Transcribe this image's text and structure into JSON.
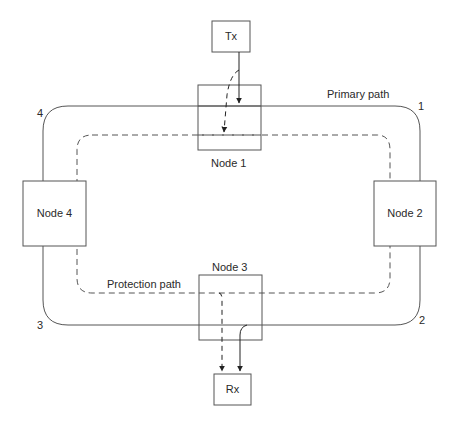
{
  "diagram": {
    "type": "ring network protection diagram",
    "nodes": [
      {
        "id": "node1",
        "label": "Node 1"
      },
      {
        "id": "node2",
        "label": "Node 2"
      },
      {
        "id": "node3",
        "label": "Node 3"
      },
      {
        "id": "node4",
        "label": "Node 4"
      }
    ],
    "endpoints": {
      "tx": {
        "label": "Tx"
      },
      "rx": {
        "label": "Rx"
      }
    },
    "paths": {
      "primary": {
        "label": "Primary path",
        "style": "solid"
      },
      "protection": {
        "label": "Protection path",
        "style": "dashed"
      }
    },
    "corners": [
      "1",
      "2",
      "3",
      "4"
    ],
    "colors": {
      "line": "#555555",
      "text": "#2a2a2a",
      "background": "#ffffff"
    }
  }
}
